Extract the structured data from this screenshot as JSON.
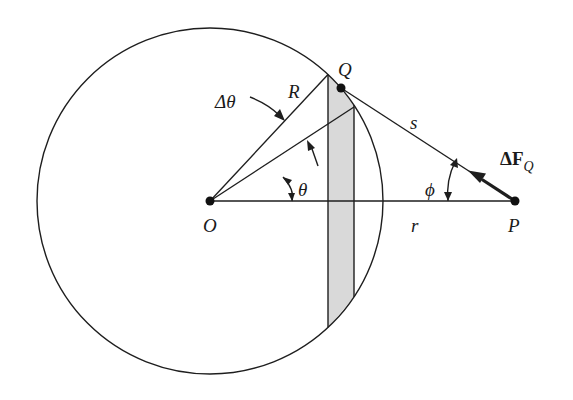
{
  "diagram": {
    "type": "geometry",
    "colors": {
      "line": "#1e1e1e",
      "strip_fill": "#d9d9d9",
      "background": "#ffffff"
    },
    "labels": {
      "center": "O",
      "surface_point": "Q",
      "external_point": "P",
      "radius": "R",
      "distance_QP": "s",
      "distance_OP": "r",
      "delta_theta": "Δθ",
      "theta": "θ",
      "phi": "ϕ",
      "force_main": "ΔF",
      "force_sub": "Q"
    },
    "geometry": {
      "O": [
        210,
        201
      ],
      "P": [
        515,
        201
      ],
      "Q": [
        341,
        88
      ],
      "circle_radius": 173,
      "ray_upper_end": [
        328,
        74
      ],
      "ray_lower_end": [
        354,
        108
      ],
      "strip_x": [
        328,
        354
      ]
    }
  }
}
